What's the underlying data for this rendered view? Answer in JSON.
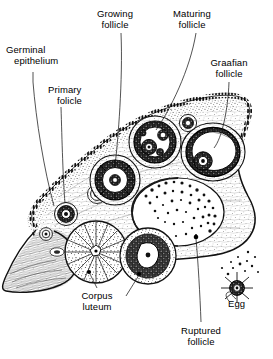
{
  "figure": {
    "ink_color": "#000000",
    "background_color": "#ffffff",
    "width": 273,
    "height": 359
  },
  "labels": {
    "germinal_epithelium": {
      "line1": "Germinal",
      "line2": "epithelium"
    },
    "primary_folicle": {
      "line1": "Primary",
      "line2": "folicle"
    },
    "growing_follicle": {
      "line1": "Growing",
      "line2": "follicle"
    },
    "maturing_follicle": {
      "line1": "Maturing",
      "line2": "follicle"
    },
    "graafian_follicle": {
      "line1": "Graafian",
      "line2": "follicle"
    },
    "corpus_luteum": {
      "line1": "Corpus",
      "line2": "luteum"
    },
    "ruptured_follicle": {
      "line1": "Ruptured",
      "line2": "follicle"
    },
    "egg": {
      "line1": "Egg",
      "line2": ""
    }
  }
}
